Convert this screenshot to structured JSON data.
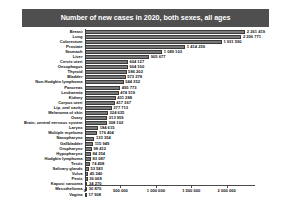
{
  "chart_data": {
    "type": "bar",
    "orientation": "horizontal",
    "title": "Number of new cases in 2020, both sexes, all ages",
    "xlabel": "",
    "ylabel": "",
    "xlim": [
      0,
      2400000
    ],
    "grid": false,
    "legend": null,
    "xticks": [
      0,
      500000,
      1000000,
      1500000,
      2000000
    ],
    "xtick_labels": [
      "0",
      "500 000",
      "1 000 000",
      "1 500 000",
      "2 000 000"
    ],
    "categories": [
      "Breast",
      "Lung",
      "Colorectum",
      "Prostate",
      "Stomach",
      "Liver",
      "Cervix uteri",
      "Oesophagus",
      "Thyroid",
      "Bladder",
      "Non-Hodgkin lymphoma",
      "Pancreas",
      "Leukaemia",
      "Kidney",
      "Corpus uteri",
      "Lip, oral cavity",
      "Melanoma of skin",
      "Ovary",
      "Brain, central nervous system",
      "Larynx",
      "Multiple myeloma",
      "Nasopharynx",
      "Gallbladder",
      "Oropharynx",
      "Hypopharynx",
      "Hodgkin lymphoma",
      "Testis",
      "Salivary glands",
      "Vulva",
      "Penis",
      "Kaposi sarcoma",
      "Mesothelioma",
      "Vagina"
    ],
    "values": [
      2261419,
      2206771,
      1931590,
      1414259,
      1089103,
      905677,
      604127,
      604100,
      586202,
      573278,
      544352,
      495773,
      474519,
      431288,
      417367,
      377713,
      324635,
      313959,
      308102,
      184615,
      176404,
      133354,
      115949,
      98412,
      84254,
      83087,
      74458,
      53583,
      45240,
      36068,
      34270,
      30870,
      17908
    ],
    "value_labels": [
      "2 261 419",
      "2 206 771",
      "1 931 590",
      "1 414 259",
      "1 089 103",
      "905 677",
      "604 127",
      "604 100",
      "586 202",
      "573 278",
      "544 352",
      "495 773",
      "474 519",
      "431 288",
      "417 367",
      "377 713",
      "324 635",
      "313 959",
      "308 102",
      "184 615",
      "176 404",
      "133 354",
      "115 949",
      "98 412",
      "84 254",
      "83 087",
      "74 458",
      "53 583",
      "45 240",
      "36 068",
      "34 270",
      "30 870",
      "17 908"
    ],
    "colors": {
      "bar_fill": "#7a7a7a",
      "bar_edge": "#3a3a3a",
      "title_background": "#4f4f4f",
      "title_text": "#ffffff",
      "axis": "#4a4a4a",
      "text": "#111111",
      "background": "#ffffff"
    }
  }
}
